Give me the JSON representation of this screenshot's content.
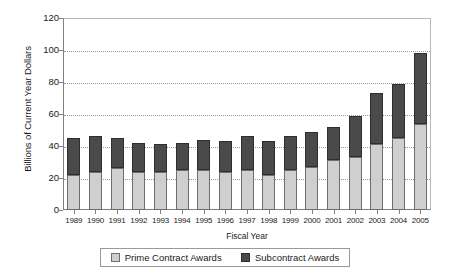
{
  "chart_data": {
    "type": "bar",
    "subtype": "stacked-vertical",
    "title": "",
    "xlabel": "Fiscal Year",
    "ylabel": "Billions of Current Year Dollars",
    "ylim": [
      0,
      120
    ],
    "yticks": [
      0,
      20,
      40,
      60,
      80,
      100,
      120
    ],
    "grid": true,
    "grid_axis": "y",
    "legend_position": "bottom",
    "categories": [
      "1989",
      "1990",
      "1991",
      "1992",
      "1993",
      "1994",
      "1995",
      "1996",
      "1997",
      "1998",
      "1999",
      "2000",
      "2001",
      "2002",
      "2003",
      "2004",
      "2005"
    ],
    "series": [
      {
        "name": "Prime Contract Awards",
        "color": "#cfcfcf",
        "values": [
          22,
          24,
          26,
          24,
          24,
          25,
          25,
          24,
          25,
          22,
          25,
          27,
          31,
          33,
          41,
          45,
          54
        ]
      },
      {
        "name": "Subcontract Awards",
        "color": "#4a4a4a",
        "values": [
          23,
          22,
          19,
          18,
          17,
          17,
          19,
          19,
          21,
          21,
          21,
          22,
          21,
          26,
          32,
          34,
          44
        ]
      }
    ],
    "totals": [
      45,
      46,
      45,
      42,
      41,
      42,
      44,
      43,
      46,
      43,
      46,
      49,
      52,
      59,
      73,
      79,
      98
    ]
  },
  "axes": {
    "y_tick_labels": [
      "0",
      "20",
      "40",
      "60",
      "80",
      "100",
      "120"
    ],
    "x_tick_labels": [
      "1989",
      "1990",
      "1991",
      "1992",
      "1993",
      "1994",
      "1995",
      "1996",
      "1997",
      "1998",
      "1999",
      "2000",
      "2001",
      "2002",
      "2003",
      "2004",
      "2005"
    ],
    "y_title": "Billions of Current Year Dollars",
    "x_title": "Fiscal Year"
  },
  "legend": {
    "entries": [
      {
        "label": "Prime Contract Awards",
        "swatch": "prime"
      },
      {
        "label": "Subcontract Awards",
        "swatch": "sub"
      }
    ]
  }
}
